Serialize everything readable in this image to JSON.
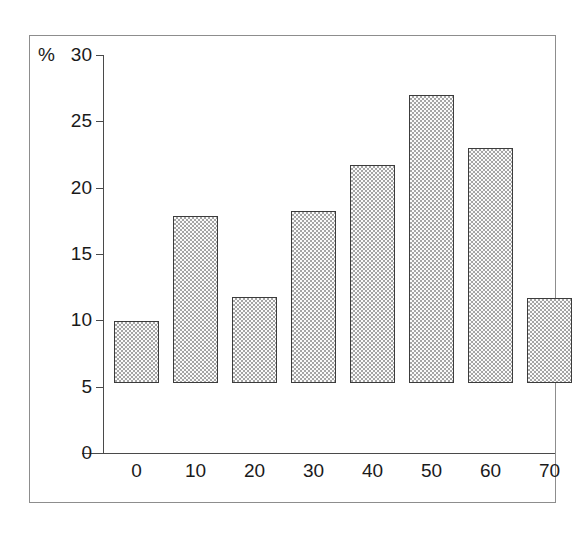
{
  "chart_data": {
    "type": "bar",
    "title": "",
    "subtitle": "",
    "xlabel": "Alter",
    "ylabel": "%",
    "categories": [
      "0",
      "10",
      "20",
      "30",
      "40",
      "50",
      "60",
      "70"
    ],
    "values": [
      4.7,
      12.6,
      6.5,
      13.0,
      16.4,
      21.7,
      17.7,
      6.4
    ],
    "ylim": [
      0,
      30
    ],
    "yticks": [
      0,
      5,
      10,
      15,
      20,
      25,
      30
    ],
    "ytick_labels": [
      "0",
      "5",
      "10",
      "15",
      "20",
      "25",
      "30"
    ],
    "xlim": [
      null,
      null
    ],
    "grid": false,
    "legend": null,
    "legend_position": "none",
    "annotations": [],
    "series": [
      {
        "name": "Anteil",
        "values": [
          4.7,
          12.6,
          6.5,
          13.0,
          16.4,
          21.7,
          17.7,
          6.4
        ]
      }
    ]
  },
  "axes": {
    "y_unit_symbol": "%",
    "y_top_label": "30",
    "x_axis_title": "Alter"
  },
  "colors": {
    "frame_border": "#8d8d8d",
    "axis_line": "#4a4a4a",
    "bar_outline": "#3c3c3c",
    "bar_fill": "#d6d6d6",
    "text": "#1a1a1a",
    "background": "#ffffff"
  }
}
